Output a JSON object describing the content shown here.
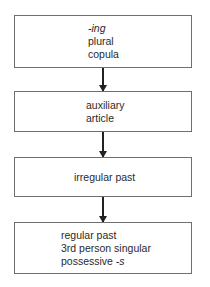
{
  "diagram": {
    "type": "flowchart",
    "direction": "top-to-bottom",
    "boxes": [
      {
        "lines": [
          {
            "pre": "",
            "italic": "-ing",
            "post": ""
          },
          {
            "pre": "plural",
            "italic": "",
            "post": ""
          },
          {
            "pre": "copula",
            "italic": "",
            "post": ""
          }
        ]
      },
      {
        "lines": [
          {
            "pre": "auxiliary",
            "italic": "",
            "post": ""
          },
          {
            "pre": "article",
            "italic": "",
            "post": ""
          }
        ]
      },
      {
        "lines": [
          {
            "pre": "irregular past",
            "italic": "",
            "post": ""
          }
        ]
      },
      {
        "lines": [
          {
            "pre": "regular past",
            "italic": "",
            "post": ""
          },
          {
            "pre": "3rd person singular",
            "italic": "",
            "post": ""
          },
          {
            "pre": "possessive ",
            "italic": "-s",
            "post": ""
          }
        ]
      }
    ],
    "arrows": [
      {
        "from": 0,
        "to": 1
      },
      {
        "from": 1,
        "to": 2
      },
      {
        "from": 2,
        "to": 3
      }
    ],
    "colors": {
      "border": "#6f6f6f",
      "arrow": "#222222",
      "text": "#2a2a2a"
    }
  }
}
